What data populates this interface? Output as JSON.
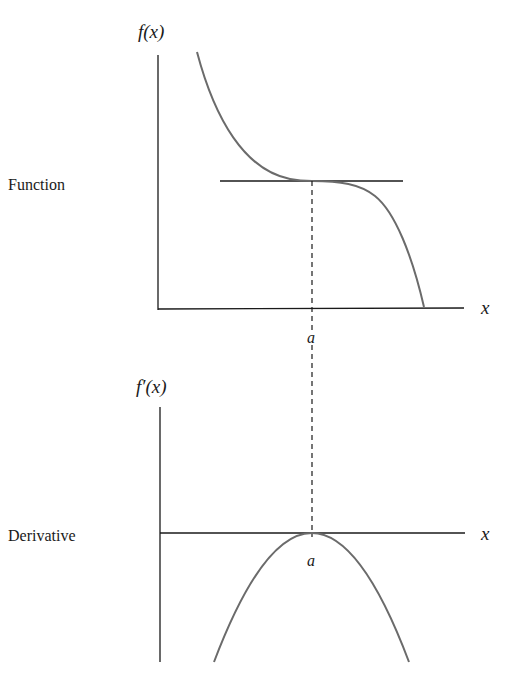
{
  "diagram": {
    "colors": {
      "axis": "#1a1a1a",
      "curve": "#6b6b6b",
      "tangent": "#1a1a1a",
      "dashed": "#1a1a1a",
      "background": "#ffffff"
    },
    "top_panel": {
      "row_label": "Function",
      "y_axis_label": "f(x)",
      "x_axis_label": "x",
      "point_label": "a",
      "curve": "decreasing cubic with horizontal tangent at x = a",
      "tangent": "horizontal line touching curve at x = a"
    },
    "bottom_panel": {
      "row_label": "Derivative",
      "y_axis_label": "f′(x)",
      "x_axis_label": "x",
      "point_label": "a",
      "curve": "downward parabola with maximum 0 at x = a"
    },
    "connector": "dashed vertical line at x = a linking both panels"
  }
}
